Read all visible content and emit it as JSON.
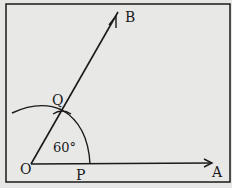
{
  "diagram": {
    "labels": {
      "O": "O",
      "A": "A",
      "B": "B",
      "P": "P",
      "Q": "Q",
      "angle": "60°"
    },
    "colors": {
      "background": "#e6e6e4",
      "stroke": "#1a1a1a"
    }
  }
}
